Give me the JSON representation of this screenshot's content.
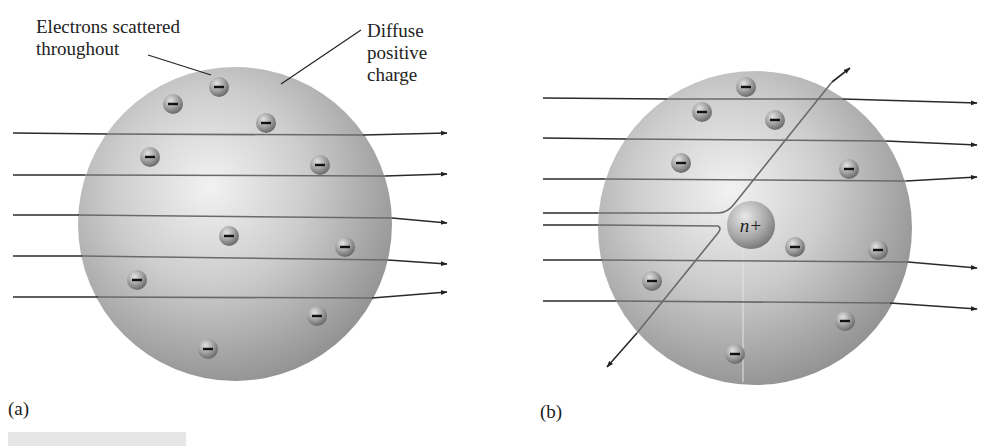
{
  "figure": {
    "panels": [
      {
        "id": "a",
        "label": "(a)",
        "model": "plum-pudding",
        "sphere": {
          "cx": 235,
          "cy": 224,
          "r": 157
        },
        "annotations": [
          {
            "text_lines": [
              "Electrons scattered",
              "throughout"
            ],
            "points_to": "electron"
          },
          {
            "text_lines": [
              "Diffuse",
              "positive",
              "charge"
            ],
            "points_to": "sphere"
          }
        ],
        "electron_symbol": "−",
        "electrons": [
          [
            219,
            87
          ],
          [
            173,
            104
          ],
          [
            266,
            123
          ],
          [
            150,
            157
          ],
          [
            320,
            165
          ],
          [
            229,
            236
          ],
          [
            345,
            247
          ],
          [
            137,
            280
          ],
          [
            317,
            316
          ],
          [
            208,
            349
          ]
        ],
        "particle_paths": 5
      },
      {
        "id": "b",
        "label": "(b)",
        "model": "nuclear",
        "sphere": {
          "cx": 755,
          "cy": 228,
          "r": 157
        },
        "nucleus": {
          "label": "n+",
          "cx": 751,
          "cy": 225,
          "r": 24
        },
        "electron_symbol": "−",
        "electrons": [
          [
            746,
            87
          ],
          [
            702,
            112
          ],
          [
            775,
            120
          ],
          [
            681,
            163
          ],
          [
            849,
            169
          ],
          [
            795,
            247
          ],
          [
            878,
            250
          ],
          [
            652,
            281
          ],
          [
            845,
            321
          ],
          [
            735,
            354
          ]
        ],
        "particle_paths": 7,
        "deflected_paths": 2
      }
    ]
  },
  "colors": {
    "sphere_light": "#ececec",
    "sphere_mid": "#c4c4c4",
    "sphere_dark": "#8e8e8e",
    "line": "#2a2a2a",
    "line_inside": "#6a6a6a",
    "text": "#222222"
  }
}
